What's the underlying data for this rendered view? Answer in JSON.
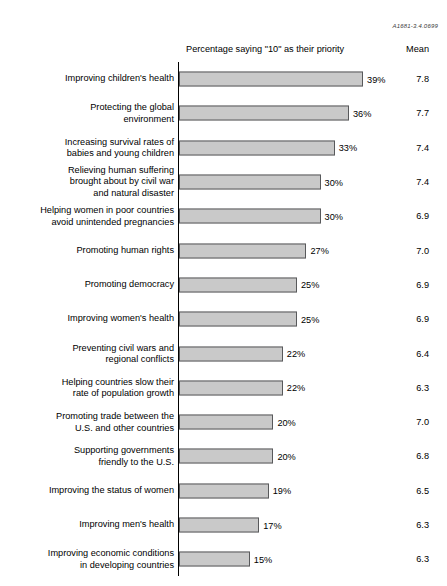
{
  "figure_ref": "A1681-3.4.0699",
  "headers": {
    "percent_column": "Percentage saying \"10\" as their priority",
    "mean_column": "Mean"
  },
  "style": {
    "bar_fill": "#c9c9c9",
    "bar_stroke": "#58595b",
    "axis_color": "#000000",
    "text_color": "#000000"
  },
  "chart_data": {
    "type": "bar",
    "orientation": "horizontal",
    "title": "",
    "xlabel": "Percentage saying \"10\" as their priority",
    "ylabel": "",
    "xlim": [
      0,
      40
    ],
    "grid": false,
    "legend": "none",
    "value_suffix": "%",
    "px_per_percent": 4.72,
    "categories": [
      "Improving children's health",
      "Protecting the global\nenvironment",
      "Increasing survival rates of\nbabies and young children",
      "Relieving human suffering\nbrought about by civil war\nand natural disaster",
      "Helping women in poor countries\navoid unintended pregnancies",
      "Promoting human rights",
      "Promoting democracy",
      "Improving women's health",
      "Preventing civil wars and\nregional conflicts",
      "Helping countries slow their\nrate of population growth",
      "Promoting trade between the\nU.S. and other countries",
      "Supporting governments\nfriendly to the U.S.",
      "Improving the status of women",
      "Improving men's health",
      "Improving economic conditions\nin developing countries"
    ],
    "values": [
      39,
      36,
      33,
      30,
      30,
      27,
      25,
      25,
      22,
      22,
      20,
      20,
      19,
      17,
      15
    ],
    "value_labels": [
      "39%",
      "36%",
      "33%",
      "30%",
      "30%",
      "27%",
      "25%",
      "25%",
      "22%",
      "22%",
      "20%",
      "20%",
      "19%",
      "17%",
      "15%"
    ],
    "series": [
      {
        "name": "Mean",
        "values": [
          7.8,
          7.7,
          7.4,
          7.4,
          6.9,
          7.0,
          6.9,
          6.9,
          6.4,
          6.3,
          7.0,
          6.8,
          6.5,
          6.3,
          6.3
        ],
        "labels": [
          "7.8",
          "7.7",
          "7.4",
          "7.4",
          "6.9",
          "7.0",
          "6.9",
          "6.9",
          "6.4",
          "6.3",
          "7.0",
          "6.8",
          "6.5",
          "6.3",
          "6.3"
        ]
      }
    ]
  }
}
